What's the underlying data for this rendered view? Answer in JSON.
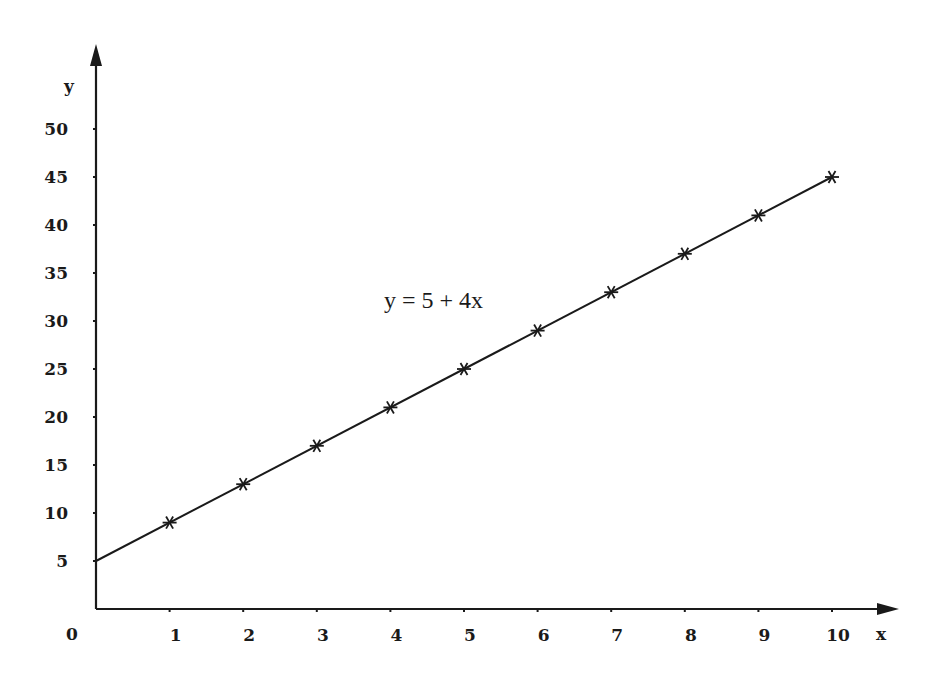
{
  "chart_data": {
    "type": "line",
    "title": "",
    "annotation": "y = 5 + 4x",
    "xlabel": "x",
    "ylabel": "y",
    "origin_label": "0",
    "x_ticks": [
      1,
      2,
      3,
      4,
      5,
      6,
      7,
      8,
      9,
      10
    ],
    "y_ticks": [
      5,
      10,
      15,
      20,
      25,
      30,
      35,
      40,
      45,
      50
    ],
    "xlim": [
      0,
      10.9
    ],
    "ylim": [
      0,
      55
    ],
    "grid": false,
    "legend": null,
    "series": [
      {
        "name": "y = 5 + 4x",
        "style": "line-with-star-markers",
        "line_x": [
          0,
          10
        ],
        "line_y": [
          5,
          45
        ],
        "x": [
          1,
          2,
          3,
          4,
          5,
          6,
          7,
          8,
          9,
          10
        ],
        "values": [
          9,
          13,
          17,
          21,
          25,
          29,
          33,
          37,
          41,
          45
        ]
      }
    ]
  },
  "colors": {
    "ink": "#1a1a1a",
    "background": "#ffffff"
  }
}
